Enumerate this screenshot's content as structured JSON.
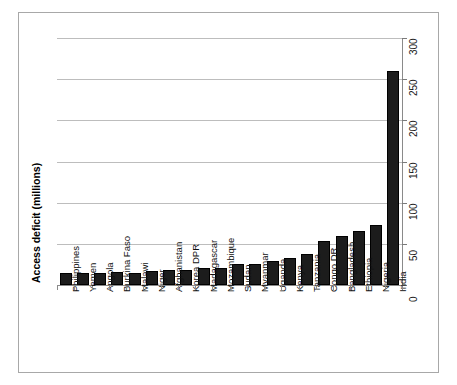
{
  "chart_data": {
    "type": "bar",
    "title": "",
    "xlabel": "",
    "ylabel": "Access deficit (millions)",
    "ylim": [
      0,
      300
    ],
    "ytick_values": [
      0,
      50,
      100,
      150,
      200,
      250,
      300
    ],
    "ytick_labels": [
      "0",
      "50",
      "100",
      "150",
      "200",
      "250",
      "300"
    ],
    "yaxis_position": "right",
    "grid": true,
    "legend": false,
    "orientation": "vertical",
    "bar_color": "#1c1c1c",
    "categories": [
      "Philippines",
      "Yemen",
      "Angola",
      "Burkina Faso",
      "Malawi",
      "Niger",
      "Afghanistan",
      "Korea DPR",
      "Madagascar",
      "Mozambique",
      "Sudan",
      "Myanmar",
      "Uganda",
      "Kenya",
      "Tanzania",
      "Congo DR",
      "Bangladesh",
      "Ethiopia",
      "Nigeria",
      "India"
    ],
    "values": [
      14,
      14,
      15,
      16,
      15,
      17,
      18,
      18,
      21,
      21,
      25,
      25,
      29,
      33,
      38,
      54,
      60,
      66,
      73,
      260
    ]
  },
  "axis": {
    "value_axis_label": "Access deficit (millions)"
  }
}
